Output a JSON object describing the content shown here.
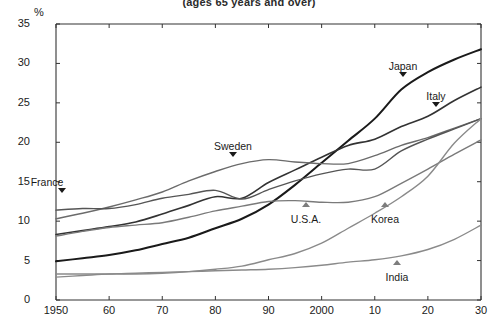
{
  "title": "(ages 65 years and over)",
  "y_unit": "%",
  "chart_data": {
    "type": "line",
    "title": "(ages 65 years and over)",
    "xlabel": "",
    "ylabel": "%",
    "xlim": [
      1950,
      2030
    ],
    "ylim": [
      0,
      35
    ],
    "ytick_labels": [
      "0",
      "5",
      "10",
      "15",
      "20",
      "25",
      "30",
      "35"
    ],
    "ytick_values": [
      0,
      5,
      10,
      15,
      20,
      25,
      30,
      35
    ],
    "xtick_labels": [
      "1950",
      "60",
      "70",
      "80",
      "90",
      "2000",
      "10",
      "20",
      "30"
    ],
    "xtick_values": [
      1950,
      1960,
      1970,
      1980,
      1990,
      2000,
      2010,
      2020,
      2030
    ],
    "grid": false,
    "legend": "inline-annotations",
    "x": [
      1950,
      1955,
      1960,
      1965,
      1970,
      1975,
      1980,
      1985,
      1990,
      1995,
      2000,
      2005,
      2010,
      2015,
      2020,
      2025,
      2030
    ],
    "series": [
      {
        "name": "Japan",
        "color": "#1a1a1a",
        "width": 2.0,
        "values": [
          4.9,
          5.3,
          5.7,
          6.3,
          7.1,
          7.9,
          9.1,
          10.3,
          12.1,
          14.6,
          17.4,
          20.2,
          23.0,
          26.7,
          28.9,
          30.5,
          31.8
        ]
      },
      {
        "name": "Italy",
        "color": "#333333",
        "width": 1.6,
        "values": [
          8.3,
          8.8,
          9.3,
          9.9,
          10.9,
          12.0,
          13.1,
          12.9,
          14.9,
          16.5,
          18.1,
          19.6,
          20.4,
          22.0,
          23.3,
          25.3,
          27.0
        ]
      },
      {
        "name": "Sweden",
        "color": "#6b6b6b",
        "width": 1.4,
        "values": [
          10.3,
          11.0,
          11.8,
          12.7,
          13.7,
          15.1,
          16.3,
          17.3,
          17.8,
          17.5,
          17.3,
          17.3,
          18.3,
          19.6,
          20.6,
          21.8,
          23.0
        ]
      },
      {
        "name": "France",
        "color": "#555555",
        "width": 1.4,
        "values": [
          11.4,
          11.6,
          11.6,
          12.1,
          12.9,
          13.4,
          13.9,
          12.8,
          14.0,
          15.1,
          16.0,
          16.6,
          16.6,
          18.9,
          20.4,
          21.7,
          23.0
        ]
      },
      {
        "name": "U.S.A.",
        "color": "#7a7a7a",
        "width": 1.4,
        "values": [
          8.1,
          8.7,
          9.2,
          9.5,
          9.8,
          10.5,
          11.3,
          11.9,
          12.5,
          12.6,
          12.4,
          12.4,
          13.1,
          14.8,
          16.6,
          18.5,
          20.3
        ]
      },
      {
        "name": "Korea",
        "color": "#8a8a8a",
        "width": 1.4,
        "values": [
          2.9,
          3.1,
          3.3,
          3.3,
          3.4,
          3.6,
          3.9,
          4.3,
          5.1,
          5.9,
          7.2,
          9.1,
          11.0,
          13.1,
          15.7,
          19.9,
          23.0
        ]
      },
      {
        "name": "India",
        "color": "#8a8a8a",
        "width": 1.4,
        "values": [
          3.3,
          3.3,
          3.3,
          3.4,
          3.5,
          3.6,
          3.7,
          3.8,
          3.9,
          4.1,
          4.4,
          4.8,
          5.1,
          5.6,
          6.4,
          7.7,
          9.5
        ]
      }
    ],
    "annotations": [
      {
        "label": "France",
        "marker": "down",
        "x_px": 47,
        "y_px": 176,
        "tri_x": 62,
        "tri_y": 188
      },
      {
        "label": "Sweden",
        "marker": "down",
        "x_px": 233,
        "y_px": 140,
        "tri_x": 233,
        "tri_y": 152
      },
      {
        "label": "Japan",
        "marker": "down",
        "x_px": 403,
        "y_px": 60,
        "tri_x": 403,
        "tri_y": 72
      },
      {
        "label": "Italy",
        "marker": "down",
        "x_px": 436,
        "y_px": 90,
        "tri_x": 436,
        "tri_y": 102
      },
      {
        "label": "U.S.A.",
        "marker": "up",
        "x_px": 306,
        "y_px": 213,
        "tri_x": 306,
        "tri_y": 202
      },
      {
        "label": "Korea",
        "marker": "up",
        "x_px": 385,
        "y_px": 213,
        "tri_x": 385,
        "tri_y": 202
      },
      {
        "label": "India",
        "marker": "up",
        "x_px": 397,
        "y_px": 271,
        "tri_x": 397,
        "tri_y": 260
      }
    ]
  }
}
